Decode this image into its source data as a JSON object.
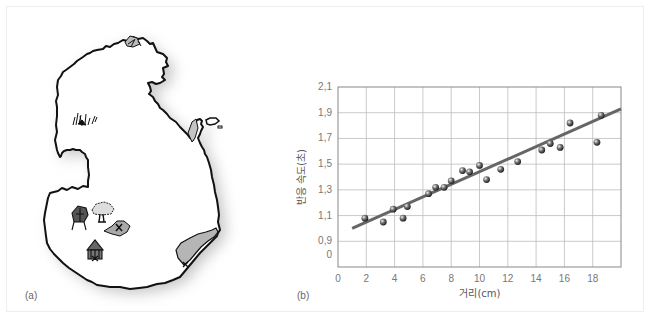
{
  "panels": {
    "a_label": "(a)",
    "b_label": "(b)"
  },
  "map": {
    "description": "hand-drawn island map",
    "landmarks": [
      "grass-patch",
      "hut",
      "hut",
      "tree",
      "marked-area-x",
      "shaded-peninsula"
    ],
    "colors": {
      "land": "#ffffff",
      "outline": "#111111",
      "shaded": "#b5b5b5",
      "shadow": "#cfcfcf"
    }
  },
  "chart_data": {
    "type": "scatter",
    "title": "",
    "xlabel": "거리(cm)",
    "ylabel": "반응 속도(초)",
    "xlim": [
      0,
      20
    ],
    "ylim_display": [
      0.7,
      2.1
    ],
    "x_ticks": [
      "0",
      "2",
      "4",
      "6",
      "8",
      "10",
      "12",
      "14",
      "16",
      "18"
    ],
    "y_ticks": [
      "2,1",
      "1,9",
      "1,7",
      "1,5",
      "1,3",
      "1,1",
      "0,9",
      "0"
    ],
    "grid": true,
    "y_axis_break": "bottom row labeled 0 (broken axis)",
    "points": [
      {
        "x": 1.9,
        "y": 1.08
      },
      {
        "x": 3.2,
        "y": 1.05
      },
      {
        "x": 3.9,
        "y": 1.15
      },
      {
        "x": 4.6,
        "y": 1.08
      },
      {
        "x": 4.9,
        "y": 1.17
      },
      {
        "x": 6.4,
        "y": 1.27
      },
      {
        "x": 6.9,
        "y": 1.32
      },
      {
        "x": 7.5,
        "y": 1.32
      },
      {
        "x": 8.0,
        "y": 1.37
      },
      {
        "x": 8.8,
        "y": 1.45
      },
      {
        "x": 9.3,
        "y": 1.44
      },
      {
        "x": 10.0,
        "y": 1.49
      },
      {
        "x": 10.5,
        "y": 1.38
      },
      {
        "x": 11.5,
        "y": 1.46
      },
      {
        "x": 12.7,
        "y": 1.52
      },
      {
        "x": 14.4,
        "y": 1.61
      },
      {
        "x": 15.0,
        "y": 1.66
      },
      {
        "x": 15.7,
        "y": 1.63
      },
      {
        "x": 16.4,
        "y": 1.82
      },
      {
        "x": 18.3,
        "y": 1.67
      },
      {
        "x": 18.6,
        "y": 1.88
      }
    ],
    "trend_line": {
      "x": [
        1.0,
        20.0
      ],
      "y": [
        1.0,
        1.93
      ]
    },
    "colors": {
      "line": "#666666",
      "point": "#444444",
      "grid": "#bdbdbd",
      "axis": "#888888"
    }
  }
}
